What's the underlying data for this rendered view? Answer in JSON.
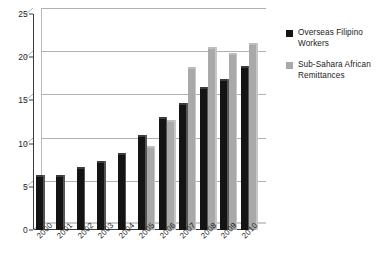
{
  "chart_data": {
    "type": "bar",
    "title": "",
    "xlabel": "",
    "ylabel": "",
    "ylim": [
      0,
      25
    ],
    "yticks": [
      0,
      5,
      10,
      15,
      20,
      25
    ],
    "grid": true,
    "legend_position": "right",
    "categories": [
      "2000",
      "2001",
      "2002",
      "2003",
      "2004",
      "2005",
      "2006",
      "2007",
      "2008",
      "2009",
      "2010"
    ],
    "series": [
      {
        "name": "Overseas Filipino Workers",
        "color": "#141414",
        "values": [
          6.1,
          6.1,
          7.1,
          7.8,
          8.7,
          10.8,
          12.8,
          14.5,
          16.3,
          17.3,
          18.8
        ]
      },
      {
        "name": "Sub-Sahara African Remittances",
        "color": "#a9a9a9",
        "values": [
          null,
          null,
          null,
          null,
          null,
          9.5,
          12.5,
          18.6,
          21.0,
          20.3,
          21.4
        ]
      }
    ]
  },
  "legend": {
    "items": [
      {
        "label": "Overseas Filipino Workers",
        "color": "#141414"
      },
      {
        "label": "Sub-Sahara African Remittances",
        "color": "#a9a9a9"
      }
    ]
  }
}
